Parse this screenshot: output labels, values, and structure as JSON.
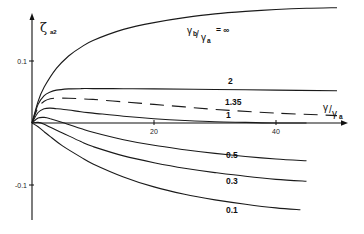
{
  "chart_data": {
    "type": "line",
    "title": "",
    "ylabel": "ζ_a2",
    "xlabel": "γ/γa",
    "xlim": [
      0,
      50
    ],
    "ylim": [
      -0.16,
      0.19
    ],
    "grid": false,
    "x_ticks": [
      {
        "value": 20,
        "label": "20"
      },
      {
        "value": 40,
        "label": "40"
      }
    ],
    "y_ticks": [
      {
        "value": 0.1,
        "label": "0.1"
      },
      {
        "value": -0.1,
        "label": "-0.1"
      }
    ],
    "xlabel_parts": {
      "main": "γ",
      "slash": "/",
      "sub_main": "γ",
      "sub": "a"
    },
    "ylabel_parts": {
      "main": "ζ",
      "sub": "a2"
    },
    "series": [
      {
        "name": "∞",
        "label": "= ∞",
        "label_prefix": {
          "num": "γ",
          "num_sub": "b",
          "den": "γ",
          "den_sub": "a"
        },
        "style": "solid",
        "x": [
          0,
          1,
          2,
          4,
          6,
          8,
          10,
          15,
          20,
          25,
          30,
          35,
          40,
          45,
          50
        ],
        "y": [
          0,
          0.035,
          0.058,
          0.088,
          0.108,
          0.122,
          0.133,
          0.151,
          0.162,
          0.17,
          0.176,
          0.18,
          0.183,
          0.185,
          0.186
        ]
      },
      {
        "name": "2",
        "label": "2",
        "style": "solid",
        "x": [
          0,
          1,
          2,
          3,
          4,
          6,
          8,
          10,
          15,
          20,
          30,
          40,
          50
        ],
        "y": [
          0,
          0.03,
          0.044,
          0.05,
          0.053,
          0.055,
          0.0555,
          0.0555,
          0.0553,
          0.055,
          0.054,
          0.053,
          0.052
        ]
      },
      {
        "name": "1.35",
        "label": "1.35",
        "style": "dashed",
        "x": [
          0,
          1,
          2,
          3,
          4,
          6,
          8,
          10,
          15,
          20,
          25,
          30,
          40,
          50
        ],
        "y": [
          0,
          0.025,
          0.035,
          0.039,
          0.04,
          0.04,
          0.039,
          0.038,
          0.034,
          0.03,
          0.026,
          0.022,
          0.016,
          0.012
        ]
      },
      {
        "name": "1",
        "label": "1",
        "style": "solid",
        "x": [
          0,
          1,
          2,
          3,
          4,
          6,
          8,
          10,
          15,
          20,
          25,
          30,
          35,
          40,
          45
        ],
        "y": [
          0,
          0.017,
          0.023,
          0.024,
          0.023,
          0.021,
          0.018,
          0.016,
          0.011,
          0.007,
          0.004,
          0.002,
          0.001,
          0.0,
          0.0
        ]
      },
      {
        "name": "0.5",
        "label": "0.5",
        "style": "solid",
        "x": [
          0,
          1,
          2,
          3,
          5,
          8,
          10,
          15,
          20,
          25,
          30,
          35,
          40,
          45
        ],
        "y": [
          0,
          0.008,
          0.009,
          0.007,
          0.001,
          -0.009,
          -0.015,
          -0.027,
          -0.036,
          -0.043,
          -0.049,
          -0.054,
          -0.058,
          -0.061
        ]
      },
      {
        "name": "0.3",
        "label": "0.3",
        "style": "solid",
        "x": [
          0,
          1,
          2,
          3,
          5,
          8,
          10,
          15,
          20,
          25,
          30,
          35,
          40,
          45
        ],
        "y": [
          0,
          0.001,
          -0.002,
          -0.007,
          -0.016,
          -0.03,
          -0.038,
          -0.053,
          -0.064,
          -0.073,
          -0.08,
          -0.086,
          -0.091,
          -0.094
        ]
      },
      {
        "name": "0.1",
        "label": "0.1",
        "style": "solid",
        "x": [
          0,
          1,
          2,
          3,
          5,
          8,
          10,
          15,
          20,
          25,
          30,
          35,
          40,
          44
        ],
        "y": [
          0,
          -0.006,
          -0.014,
          -0.022,
          -0.037,
          -0.055,
          -0.066,
          -0.087,
          -0.103,
          -0.115,
          -0.124,
          -0.131,
          -0.137,
          -0.14
        ]
      }
    ]
  }
}
